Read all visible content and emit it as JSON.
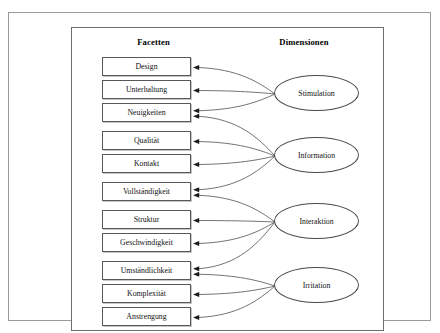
{
  "figure": {
    "headings": {
      "left": "Facetten",
      "right": "Dimensionen"
    },
    "facets": [
      {
        "id": "design",
        "label": "Design"
      },
      {
        "id": "unterhaltung",
        "label": "Unterhaltung"
      },
      {
        "id": "neuigkeiten",
        "label": "Neuigkeiten"
      },
      {
        "id": "qualitaet",
        "label": "Qualität"
      },
      {
        "id": "kontakt",
        "label": "Kontakt"
      },
      {
        "id": "vollstaendigkeit",
        "label": "Vollständigkeit"
      },
      {
        "id": "struktur",
        "label": "Struktur"
      },
      {
        "id": "geschwindigkeit",
        "label": "Geschwindigkeit"
      },
      {
        "id": "umstaendlichkeit",
        "label": "Umständlichkeit"
      },
      {
        "id": "komplexitaet",
        "label": "Komplexität"
      },
      {
        "id": "anstrengung",
        "label": "Anstrengung"
      }
    ],
    "dimensions": [
      {
        "id": "stimulation",
        "label": "Stimulation"
      },
      {
        "id": "information",
        "label": "Information"
      },
      {
        "id": "interaktion",
        "label": "Interaktion"
      },
      {
        "id": "irritation",
        "label": "Irritation"
      }
    ],
    "links": [
      {
        "from": "stimulation",
        "to": "design"
      },
      {
        "from": "stimulation",
        "to": "unterhaltung"
      },
      {
        "from": "stimulation",
        "to": "neuigkeiten"
      },
      {
        "from": "information",
        "to": "neuigkeiten"
      },
      {
        "from": "information",
        "to": "qualitaet"
      },
      {
        "from": "information",
        "to": "kontakt"
      },
      {
        "from": "information",
        "to": "vollstaendigkeit"
      },
      {
        "from": "interaktion",
        "to": "vollstaendigkeit"
      },
      {
        "from": "interaktion",
        "to": "struktur"
      },
      {
        "from": "interaktion",
        "to": "geschwindigkeit"
      },
      {
        "from": "interaktion",
        "to": "umstaendlichkeit"
      },
      {
        "from": "irritation",
        "to": "umstaendlichkeit"
      },
      {
        "from": "irritation",
        "to": "komplexitaet"
      },
      {
        "from": "irritation",
        "to": "anstrengung"
      }
    ],
    "colors": {
      "box_border": "#585858",
      "ellipse_border": "#4a4a4a",
      "connector": "#4f4f4f",
      "arrowhead": "#1a1a1a",
      "frame": "#9a9a9a",
      "background": "#ffffff"
    }
  }
}
